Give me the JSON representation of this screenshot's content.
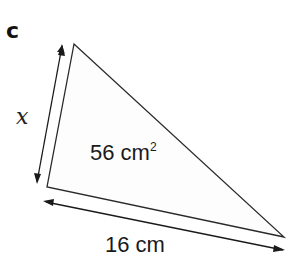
{
  "part_label": "c",
  "triangle": {
    "vertices": {
      "top": [
        74,
        44
      ],
      "bottom_left": [
        47,
        187
      ],
      "right": [
        284,
        237
      ]
    },
    "stroke_color": "#2a2a2a",
    "fill_color": "#fdfdfd"
  },
  "labels": {
    "side_variable": "x",
    "area_value": "56 cm",
    "area_exponent": "2",
    "base_length": "16 cm"
  },
  "arrows": {
    "left_side": {
      "from": [
        37,
        182
      ],
      "to": [
        62,
        46
      ]
    },
    "base": {
      "from": [
        46,
        202
      ],
      "to": [
        283,
        250
      ]
    }
  }
}
